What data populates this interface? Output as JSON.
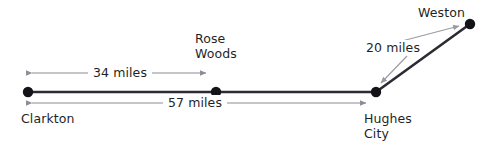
{
  "diagram": {
    "type": "route-distance-diagram",
    "colors": {
      "route_line": "#2b2b33",
      "node_dot": "#141418",
      "dimension_line": "#8d8d95",
      "leader_line": "#9a9aa2",
      "text": "#1f1f27",
      "background": "#ffffff"
    },
    "cities": [
      {
        "id": "clarkton",
        "label": "Clarkton",
        "x": 28,
        "y": 92
      },
      {
        "id": "rose-woods",
        "label_line1": "Rose",
        "label_line2": "Woods",
        "x": 216,
        "y": 92
      },
      {
        "id": "hughes-city",
        "label_line1": "Hughes",
        "label_line2": "City",
        "x": 376,
        "y": 92
      },
      {
        "id": "weston",
        "label": "Weston",
        "x": 470,
        "y": 24
      }
    ],
    "distances": [
      {
        "id": "clarkton-to-rose-woods",
        "label": "34 miles",
        "value": 34,
        "unit": "miles",
        "from": "Clarkton",
        "to": "Rose Woods"
      },
      {
        "id": "clarkton-to-hughes-city",
        "label": "57 miles",
        "value": 57,
        "unit": "miles",
        "from": "Clarkton",
        "to": "Hughes City"
      },
      {
        "id": "hughes-city-to-weston",
        "label": "20 miles",
        "value": 20,
        "unit": "miles",
        "from": "Hughes City",
        "to": "Weston"
      }
    ]
  }
}
